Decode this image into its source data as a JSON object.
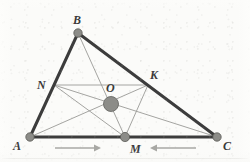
{
  "figure": {
    "kind": "geometry-diagram",
    "background_color": "#fbfbf9",
    "outline_color": "#3c3c3c",
    "cevian_color": "#9a9a96",
    "point_fill_color": "#8c8c88",
    "point_stroke_color": "#5a5a56",
    "label_color": "#3a3a3a",
    "arrow_color": "#a8a8a4",
    "bottom_rule_color": "#dcdcd8",
    "points": [
      {
        "id": "A",
        "label": "A",
        "x": 30,
        "y": 137,
        "radius": 4.2,
        "label_x": 13,
        "label_y": 140
      },
      {
        "id": "B",
        "label": "B",
        "x": 78,
        "y": 33,
        "radius": 4.2,
        "label_x": 73,
        "label_y": 14
      },
      {
        "id": "C",
        "label": "C",
        "x": 217,
        "y": 137,
        "radius": 4.2,
        "label_x": 223,
        "label_y": 140
      },
      {
        "id": "M",
        "label": "M",
        "x": 125,
        "y": 137,
        "radius": 4.6,
        "label_x": 130,
        "label_y": 143
      },
      {
        "id": "N",
        "label": "N",
        "x": 54,
        "y": 85,
        "radius": 0,
        "label_x": 37,
        "label_y": 79
      },
      {
        "id": "K",
        "label": "K",
        "x": 148,
        "y": 85,
        "radius": 0,
        "label_x": 150,
        "label_y": 69
      },
      {
        "id": "O",
        "label": "O",
        "x": 111,
        "y": 104,
        "radius": 7.5,
        "label_x": 106,
        "label_y": 82
      }
    ],
    "triangle_sides": [
      {
        "name": "side-AB",
        "from": "A",
        "to": "B",
        "width": 3.0
      },
      {
        "name": "side-BC",
        "from": "B",
        "to": "C",
        "width": 3.0
      },
      {
        "name": "side-AC",
        "from": "A",
        "to": "C",
        "width": 3.0
      }
    ],
    "inner_segments": [
      {
        "name": "median-B-M",
        "from": "B",
        "to": "M",
        "width": 0.9
      },
      {
        "name": "median-A-K",
        "from": "A",
        "to": "K",
        "width": 0.9
      },
      {
        "name": "median-C-N",
        "from": "C",
        "to": "N",
        "width": 0.9
      },
      {
        "name": "midsegment-N-K",
        "from": "N",
        "to": "K",
        "width": 0.9
      },
      {
        "name": "midsegment-N-M",
        "from": "N",
        "to": "M",
        "width": 0.9
      },
      {
        "name": "midsegment-M-K",
        "from": "M",
        "to": "K",
        "width": 0.9
      }
    ],
    "arrows": [
      {
        "name": "arrow-right",
        "direction": "right",
        "x1": 55,
        "x2": 101,
        "y": 148
      },
      {
        "name": "arrow-left",
        "direction": "left",
        "x1": 196,
        "x2": 150,
        "y": 148
      }
    ]
  }
}
